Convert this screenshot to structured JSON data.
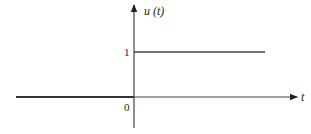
{
  "diagram": {
    "y_axis_label": "u (t)",
    "x_axis_label": "t",
    "origin_label": "0",
    "step_level_label": "1",
    "colors": {
      "axis": "#333333",
      "function": "#444444",
      "text": "#222222"
    }
  }
}
